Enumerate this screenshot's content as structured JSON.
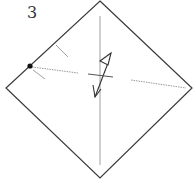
{
  "diagram": {
    "step_number": "3",
    "colors": {
      "outline": "#3a3a3a",
      "crease": "#a0a0a0",
      "dotted": "#999999",
      "arrow": "#333333",
      "dot": "#111111"
    },
    "square": {
      "top": [
        100,
        1
      ],
      "right": [
        192,
        88
      ],
      "bottom": [
        100,
        178
      ],
      "left": [
        6,
        88
      ]
    },
    "marks": {
      "reference_dot": [
        30,
        66
      ],
      "vertical_crease": {
        "x": 100,
        "y1": 16,
        "y2": 165
      },
      "pinch_marks": [
        {
          "x1": 56,
          "y1": 45,
          "x2": 68,
          "y2": 57
        },
        {
          "x1": 33,
          "y1": 70,
          "x2": 45,
          "y2": 79
        }
      ],
      "dotted_lines": [
        {
          "x1": 32,
          "y1": 67,
          "x2": 78,
          "y2": 73
        },
        {
          "x1": 131,
          "y1": 80,
          "x2": 186,
          "y2": 88
        }
      ],
      "cross_mark": {
        "x1": 88,
        "y1": 74,
        "x2": 113,
        "y2": 77
      }
    }
  }
}
